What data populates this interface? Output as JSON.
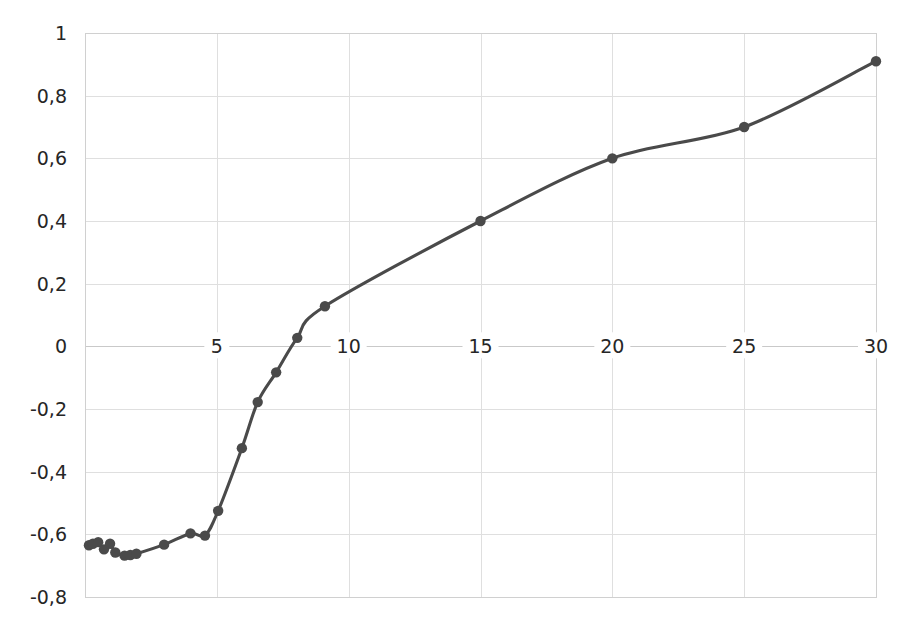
{
  "chart_data": {
    "type": "line",
    "title": "",
    "subtitle": "",
    "xlabel": "",
    "ylabel": "",
    "xlim": [
      0,
      30
    ],
    "ylim": [
      -0.8,
      1.0
    ],
    "grid": true,
    "legend": false,
    "legend_position": "none",
    "decimal_separator": ",",
    "marker": "circle",
    "marker_size": 6,
    "line_color": "#4a4a4a",
    "marker_color": "#4a4a4a",
    "grid_color": "#dfdfdf",
    "background_color": "#ffffff",
    "y_ticks": [
      1,
      0.8,
      0.6,
      0.4,
      0.2,
      0,
      -0.2,
      -0.4,
      -0.6,
      -0.8
    ],
    "y_tick_labels": [
      "1",
      "0,8",
      "0,6",
      "0,4",
      "0,2",
      "0",
      "-0,2",
      "-0,4",
      "-0,6",
      "-0,8"
    ],
    "x_ticks": [
      5,
      10,
      15,
      20,
      25,
      30
    ],
    "x_tick_labels": [
      "5",
      "10",
      "15",
      "20",
      "25",
      "30"
    ],
    "x_tick_labels_inline_at_y": 0,
    "series": [
      {
        "name": "series-1",
        "color": "#4a4a4a",
        "x": [
          0.15,
          0.3,
          0.5,
          0.7,
          0.9,
          1.1,
          1.5,
          1.7,
          1.9,
          3.0,
          4.0,
          4.5,
          5.0,
          5.6,
          6.0,
          7.0,
          8.0,
          9.0,
          10.0,
          15.0,
          20.0,
          25.0,
          30.0
        ],
        "y": [
          -0.635,
          -0.63,
          -0.625,
          -0.645,
          -0.632,
          -0.655,
          -0.668,
          -0.665,
          -0.662,
          -0.633,
          -0.597,
          -0.604,
          -0.525,
          -0.325,
          -0.178,
          -0.083,
          0.027,
          0.128,
          0.128,
          0.4,
          0.6,
          0.7,
          0.91
        ],
        "points": [
          {
            "x": 0.15,
            "y": -0.635
          },
          {
            "x": 0.3,
            "y": -0.63
          },
          {
            "x": 0.5,
            "y": -0.625
          },
          {
            "x": 0.72,
            "y": -0.648
          },
          {
            "x": 0.95,
            "y": -0.63
          },
          {
            "x": 1.15,
            "y": -0.658
          },
          {
            "x": 1.5,
            "y": -0.668
          },
          {
            "x": 1.72,
            "y": -0.666
          },
          {
            "x": 1.95,
            "y": -0.662
          },
          {
            "x": 3.0,
            "y": -0.633
          },
          {
            "x": 4.0,
            "y": -0.597
          },
          {
            "x": 4.55,
            "y": -0.604
          },
          {
            "x": 5.05,
            "y": -0.525
          },
          {
            "x": 5.95,
            "y": -0.325
          },
          {
            "x": 6.55,
            "y": -0.178
          },
          {
            "x": 7.25,
            "y": -0.083
          },
          {
            "x": 8.05,
            "y": 0.027
          },
          {
            "x": 9.1,
            "y": 0.128
          },
          {
            "x": 15.0,
            "y": 0.4
          },
          {
            "x": 20.0,
            "y": 0.6
          },
          {
            "x": 25.0,
            "y": 0.7
          },
          {
            "x": 30.0,
            "y": 0.91
          }
        ]
      }
    ]
  }
}
